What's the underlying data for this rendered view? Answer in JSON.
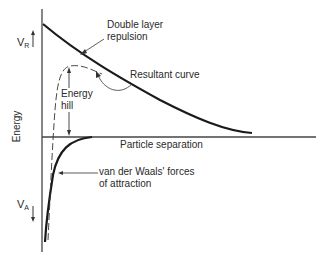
{
  "diagram": {
    "y_axis_label": "Energy",
    "x_axis_label": "Particle separation",
    "repulsion_symbol": {
      "main": "V",
      "sub": "R"
    },
    "attraction_symbol": {
      "main": "V",
      "sub": "A"
    },
    "labels": {
      "repulsion_line1": "Double layer",
      "repulsion_line2": "repulsion",
      "resultant": "Resultant curve",
      "hill_line1": "Energy",
      "hill_line2": "hill",
      "attraction_line1": "van der Waals' forces",
      "attraction_line2": "of attraction"
    },
    "colors": {
      "curve": "#1a1a1a",
      "axis": "#444444",
      "text": "#2a2a2a",
      "background": "#ffffff"
    }
  }
}
